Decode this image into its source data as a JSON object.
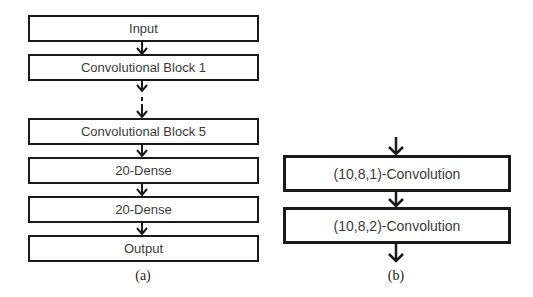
{
  "diagram_a": {
    "caption": "(a)",
    "blocks": [
      {
        "label": "Input"
      },
      {
        "label": "Convolutional Block 1"
      },
      {
        "label": "Convolutional Block 5"
      },
      {
        "label": "20-Dense"
      },
      {
        "label": "20-Dense"
      },
      {
        "label": "Output"
      }
    ],
    "ellipsis_between": [
      "Convolutional Block 1",
      "Convolutional Block 5"
    ]
  },
  "diagram_b": {
    "caption": "(b)",
    "blocks": [
      {
        "label": "(10,8,1)-Convolution"
      },
      {
        "label": "(10,8,2)-Convolution"
      }
    ]
  },
  "colors": {
    "stroke": "#1a1a1a",
    "text": "#3a3a3a",
    "background": "#ffffff"
  }
}
